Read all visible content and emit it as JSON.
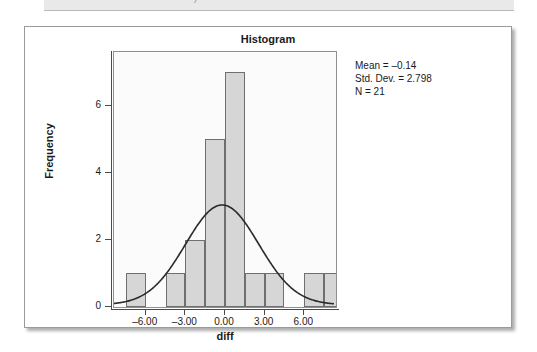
{
  "top_fragment": {
    "text": ")"
  },
  "figure": {
    "title": "Histogram",
    "stats": {
      "mean": "Mean = –0.14",
      "std_dev": "Std. Dev. = 2.798",
      "n": "N = 21"
    }
  },
  "chart_data": {
    "type": "bar",
    "title": "Histogram",
    "xlabel": "diff",
    "ylabel": "Frequency",
    "xlim": [
      -8.4,
      8.4
    ],
    "ylim": [
      0,
      7.6
    ],
    "xticks": [
      -6,
      -3,
      0,
      3,
      6
    ],
    "xticklabels": [
      "–6.00",
      "–3.00",
      "0.00",
      "3.00",
      "6.00"
    ],
    "yticks": [
      0,
      2,
      4,
      6
    ],
    "yticklabels": [
      "0",
      "2",
      "4",
      "6"
    ],
    "grid": false,
    "bin_width": 1.5,
    "bins": [
      {
        "left": -7.5,
        "right": -6.0,
        "frequency": 1
      },
      {
        "left": -6.0,
        "right": -4.5,
        "frequency": 0
      },
      {
        "left": -4.5,
        "right": -3.0,
        "frequency": 1
      },
      {
        "left": -3.0,
        "right": -1.5,
        "frequency": 2
      },
      {
        "left": -1.5,
        "right": 0.0,
        "frequency": 5
      },
      {
        "left": 0.0,
        "right": 1.5,
        "frequency": 7
      },
      {
        "left": 1.5,
        "right": 3.0,
        "frequency": 1
      },
      {
        "left": 3.0,
        "right": 4.5,
        "frequency": 1
      },
      {
        "left": 4.5,
        "right": 6.0,
        "frequency": 0
      },
      {
        "left": 6.0,
        "right": 7.5,
        "frequency": 1
      },
      {
        "left": 7.5,
        "right": 9.0,
        "frequency": 1
      }
    ],
    "overlay": {
      "type": "normal-curve",
      "mean": -0.14,
      "std_dev": 2.798,
      "n": 21,
      "peak_frequency": 3.0
    },
    "annotations": [
      "Mean = –0.14",
      "Std. Dev. = 2.798",
      "N = 21"
    ],
    "colors": {
      "bar_fill": "#d6d6d6",
      "bar_border": "#6f6f6f",
      "curve": "#2b2b2b",
      "axis": "#4a4a4a",
      "plot_background": "#fbfbfb",
      "card_background": "#ffffff"
    }
  }
}
